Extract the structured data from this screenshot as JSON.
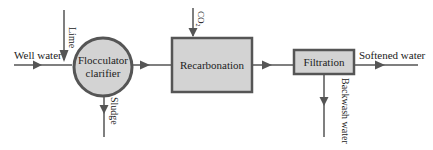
{
  "diagram": {
    "type": "process-flow",
    "nodes": {
      "flocculator": {
        "line1": "Flocculator",
        "line2": "clarifier",
        "shape": "circle"
      },
      "recarbonation": {
        "label": "Recarbonation",
        "shape": "rectangle"
      },
      "filtration": {
        "label": "Filtration",
        "shape": "rectangle"
      }
    },
    "streams": {
      "well_water": "Well water",
      "lime": "Lime",
      "sludge": "Sludge",
      "co2_main": "CO",
      "co2_sub": "2",
      "softened_water": "Softened water",
      "backwash_water": "Backwash water"
    },
    "colors": {
      "node_fill": "#d3d3d3",
      "stroke": "#555555",
      "text": "#222222",
      "background": "#ffffff"
    }
  }
}
